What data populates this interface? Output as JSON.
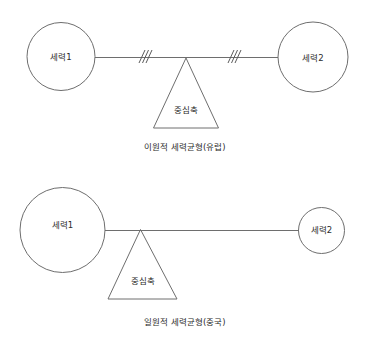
{
  "figure": {
    "background_color": "#ffffff",
    "line_color": "#6e6e6e",
    "text_color": "#2b2b2b",
    "width": 366,
    "height": 347
  },
  "diagrams": [
    {
      "id": "bipolar-balance",
      "caption": "이원적 세력균형(유럽)",
      "fulcrum_label": "중심축",
      "nodes": [
        {
          "label": "세력1",
          "side": "left",
          "radius": 34
        },
        {
          "label": "세력2",
          "side": "right",
          "radius": 35
        }
      ],
      "beam_ticks": [
        {
          "position": "left-of-center",
          "slash_count": 3
        },
        {
          "position": "right-of-center",
          "slash_count": 3
        }
      ]
    },
    {
      "id": "unipolar-balance",
      "caption": "일원적 세력균형(중국)",
      "fulcrum_label": "중심축",
      "nodes": [
        {
          "label": "세력1",
          "side": "left",
          "radius": 42
        },
        {
          "label": "세력2",
          "side": "right",
          "radius": 23
        }
      ],
      "beam_ticks": []
    }
  ]
}
